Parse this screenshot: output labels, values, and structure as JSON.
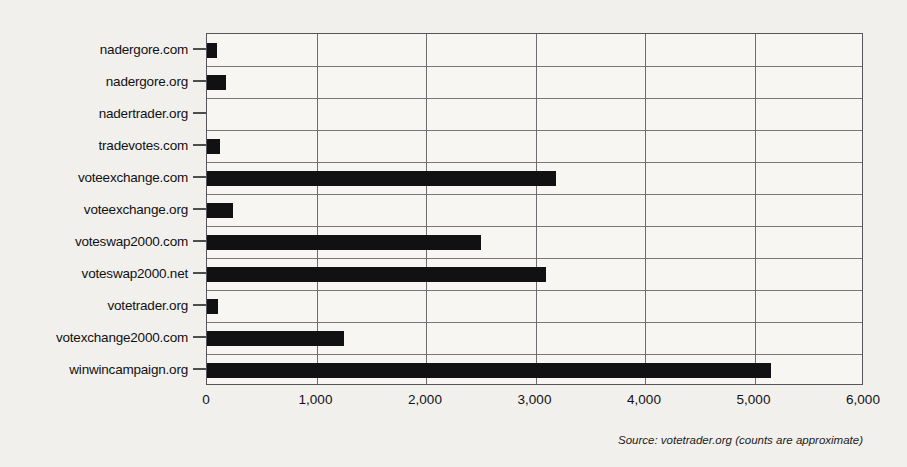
{
  "chart_data": {
    "type": "bar",
    "orientation": "horizontal",
    "title": "",
    "subtitle": "",
    "xlabel": "",
    "ylabel": "",
    "categories": [
      "nadergore.com",
      "nadergore.org",
      "nadertrader.org",
      "tradevotes.com",
      "voteexchange.com",
      "voteexchange.org",
      "voteswap2000.com",
      "voteswap2000.net",
      "votetrader.org",
      "votexchange2000.com",
      "winwincampaign.org"
    ],
    "values": [
      90,
      170,
      0,
      120,
      3190,
      240,
      2500,
      3100,
      100,
      1250,
      5150
    ],
    "xlim": [
      0,
      6000
    ],
    "xticks": [
      0,
      1000,
      2000,
      3000,
      4000,
      5000,
      6000
    ],
    "xticklabels": [
      "0",
      "1,000",
      "2,000",
      "3,000",
      "4,000",
      "5,000",
      "6,000"
    ],
    "grid": "vertical-and-horizontal",
    "legend": "none",
    "bar_color": "#111114",
    "annotation": "Source: votetrader.org (counts are approximate)"
  },
  "figure": {
    "source_note": "Source: votetrader.org (counts are approximate)",
    "background_color": "#f2f0ec",
    "plot_background_color": "#f7f6f3",
    "frame_color": "#55565a"
  }
}
